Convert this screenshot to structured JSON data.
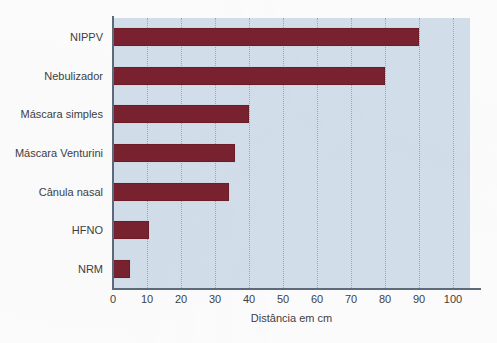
{
  "chart_data": {
    "type": "bar",
    "orientation": "horizontal",
    "title": "",
    "xlabel": "Distância em cm",
    "ylabel": "",
    "categories": [
      "NIPPV",
      "Nebulizador",
      "Máscara simples",
      "Máscara Venturini",
      "Cânula nasal",
      "HFNO",
      "NRM"
    ],
    "values": [
      90,
      80,
      40,
      36,
      34,
      10.5,
      5
    ],
    "xlim": [
      0,
      105
    ],
    "xticks": [
      0,
      10,
      20,
      30,
      40,
      50,
      60,
      70,
      80,
      90,
      100
    ],
    "xtick_labels": [
      "0",
      "10",
      "20",
      "30",
      "40",
      "50",
      "60",
      "70",
      "80",
      "90",
      "100"
    ],
    "grid": true,
    "grid_axis": "x",
    "legend": false,
    "legend_position": "none",
    "colors": {
      "bar": "#7a2230",
      "bar_border": "#6d1d29",
      "plot_background": "#d3dfeb",
      "gridline": "#9aa9bb",
      "axis": "#5d6b7a",
      "text": "#3f3f44",
      "page_background": "#fdfdfd"
    }
  }
}
